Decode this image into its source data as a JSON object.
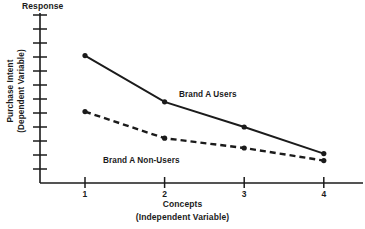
{
  "chart_data": {
    "type": "line",
    "title": "",
    "top_axis_label": "Response",
    "ylabel_line1": "Purchase Intent",
    "ylabel_line2": "(Dependent Variable)",
    "xlabel_line1": "Concepts",
    "xlabel_line2": "(Independent Variable)",
    "categories": [
      "1",
      "2",
      "3",
      "4"
    ],
    "x": [
      1,
      2,
      3,
      4
    ],
    "ylim": [
      0,
      12
    ],
    "xlim": [
      0.4,
      4.6
    ],
    "grid": false,
    "yticks": [
      1,
      2,
      3,
      4,
      5,
      6,
      7,
      8,
      9,
      10,
      11,
      12
    ],
    "ytick_labels": [
      "",
      "",
      "",
      "",
      "",
      "",
      "",
      "",
      "",
      "",
      "",
      ""
    ],
    "legend_position": "inline-annotations",
    "series": [
      {
        "name": "Brand A Users",
        "style": "solid",
        "color": "#1b1b1b",
        "marker": "circle",
        "values": [
          9.1,
          5.8,
          4.0,
          2.1
        ]
      },
      {
        "name": "Brand A Non-Users",
        "style": "dashed",
        "color": "#1b1b1b",
        "marker": "circle",
        "values": [
          5.1,
          3.2,
          2.5,
          1.6
        ]
      }
    ],
    "annotations": [
      {
        "text": "Brand A Users",
        "x": 2.2,
        "y": 6.6
      },
      {
        "text": "Brand A Non-Users",
        "x": 1.3,
        "y": 2.4
      }
    ]
  }
}
